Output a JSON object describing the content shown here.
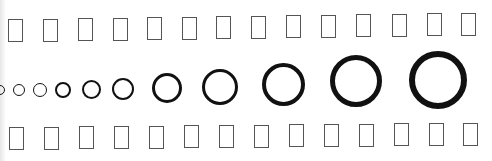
{
  "page": {
    "background": "#ffffff",
    "edge_shade": "#e6e6e6"
  },
  "rows": {
    "top_boxes": {
      "label": "Missing glyph boxes (top row)",
      "stroke": "#555555",
      "stroke_width": 1.5,
      "width": 15,
      "height": 23,
      "items": [
        {
          "x": 8,
          "y": 19
        },
        {
          "x": 43,
          "y": 19
        },
        {
          "x": 78,
          "y": 18
        },
        {
          "x": 113,
          "y": 18
        },
        {
          "x": 147,
          "y": 17
        },
        {
          "x": 182,
          "y": 17
        },
        {
          "x": 216,
          "y": 16
        },
        {
          "x": 251,
          "y": 16
        },
        {
          "x": 286,
          "y": 15
        },
        {
          "x": 321,
          "y": 15
        },
        {
          "x": 356,
          "y": 14
        },
        {
          "x": 392,
          "y": 14
        },
        {
          "x": 427,
          "y": 13
        },
        {
          "x": 461,
          "y": 13
        }
      ]
    },
    "rings": {
      "label": "Ring glyphs of increasing size and weight",
      "stroke": "#111111",
      "items": [
        {
          "cx": 0,
          "cy": 90,
          "r": 5,
          "stroke_width": 1.5
        },
        {
          "cx": 19,
          "cy": 90,
          "r": 6,
          "stroke_width": 1.5
        },
        {
          "cx": 40,
          "cy": 90,
          "r": 7,
          "stroke_width": 1.8
        },
        {
          "cx": 63,
          "cy": 90,
          "r": 8,
          "stroke_width": 2
        },
        {
          "cx": 91,
          "cy": 89,
          "r": 9.5,
          "stroke_width": 2.2
        },
        {
          "cx": 123,
          "cy": 89,
          "r": 11,
          "stroke_width": 2.5
        },
        {
          "cx": 167,
          "cy": 88,
          "r": 15,
          "stroke_width": 3
        },
        {
          "cx": 220,
          "cy": 87,
          "r": 18,
          "stroke_width": 3.5
        },
        {
          "cx": 283,
          "cy": 84,
          "r": 21.5,
          "stroke_width": 4
        },
        {
          "cx": 356,
          "cy": 81,
          "r": 26,
          "stroke_width": 5
        },
        {
          "cx": 438,
          "cy": 80,
          "r": 29,
          "stroke_width": 6
        }
      ]
    },
    "bottom_boxes": {
      "label": "Missing glyph boxes (bottom row)",
      "stroke": "#555555",
      "stroke_width": 1.5,
      "width": 15,
      "height": 23,
      "items": [
        {
          "x": 9,
          "y": 127
        },
        {
          "x": 44,
          "y": 127
        },
        {
          "x": 79,
          "y": 126
        },
        {
          "x": 114,
          "y": 126
        },
        {
          "x": 149,
          "y": 126
        },
        {
          "x": 184,
          "y": 125
        },
        {
          "x": 219,
          "y": 125
        },
        {
          "x": 254,
          "y": 125
        },
        {
          "x": 289,
          "y": 124
        },
        {
          "x": 324,
          "y": 124
        },
        {
          "x": 359,
          "y": 124
        },
        {
          "x": 394,
          "y": 123
        },
        {
          "x": 429,
          "y": 123
        },
        {
          "x": 463,
          "y": 123
        }
      ]
    }
  }
}
